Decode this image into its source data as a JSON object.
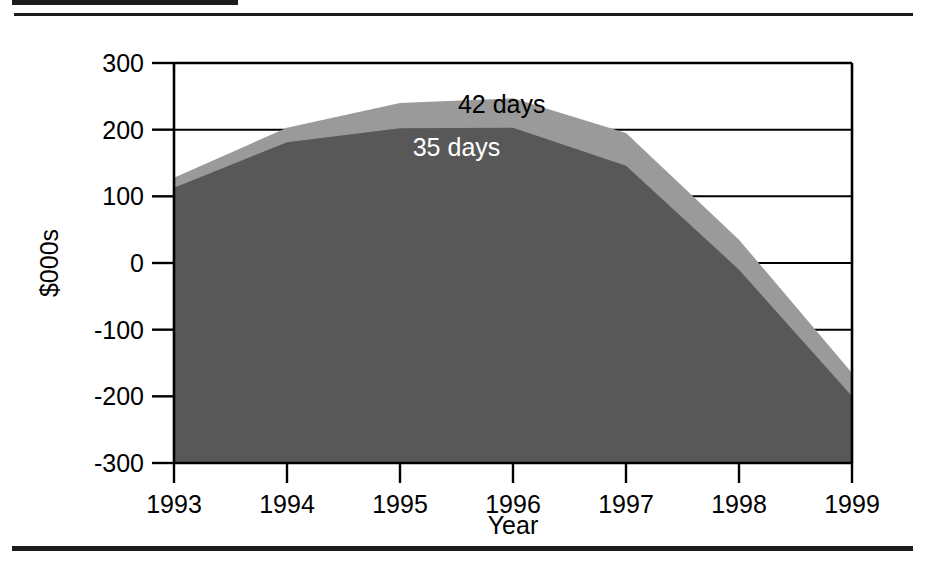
{
  "figure": {
    "has_top_rule": true,
    "has_bottom_rule": true
  },
  "chart_data": {
    "type": "area",
    "stacked": false,
    "title": "",
    "subtitle": "",
    "xlabel": "Year",
    "ylabel": "$000s",
    "categories": [
      "1993",
      "1994",
      "1995",
      "1996",
      "1997",
      "1998",
      "1999"
    ],
    "x": [
      1993,
      1994,
      1995,
      1996,
      1997,
      1998,
      1999
    ],
    "xlim": [
      1993,
      1999
    ],
    "ylim": [
      -300,
      300
    ],
    "ytick_labels": [
      "300",
      "200",
      "100",
      "0",
      "-100",
      "-200",
      "-300"
    ],
    "yticks": [
      300,
      200,
      100,
      0,
      -100,
      -200,
      -300
    ],
    "xtick_labels": [
      "1993",
      "1994",
      "1995",
      "1996",
      "1997",
      "1998",
      "1999"
    ],
    "grid": true,
    "grid_axis": "y",
    "legend": "inline-annotations",
    "series": [
      {
        "name": "42 days",
        "label": "42 days",
        "color": "#9a9a9a",
        "label_color": "#000000",
        "values": [
          128,
          203,
          240,
          247,
          195,
          35,
          -165
        ]
      },
      {
        "name": "35 days",
        "label": "35 days",
        "color": "#585858",
        "label_color": "#ffffff",
        "values": [
          113,
          181,
          202,
          203,
          146,
          -10,
          -200
        ]
      }
    ],
    "annotations": [
      {
        "text": "42 days",
        "x": 1995.9,
        "y": 225,
        "color": "#000000"
      },
      {
        "text": "35 days",
        "x": 1995.5,
        "y": 160,
        "color": "#ffffff"
      }
    ],
    "colors": {
      "upper_band": "#9a9a9a",
      "lower_band": "#585858",
      "axis": "#000000",
      "background": "#ffffff"
    }
  }
}
